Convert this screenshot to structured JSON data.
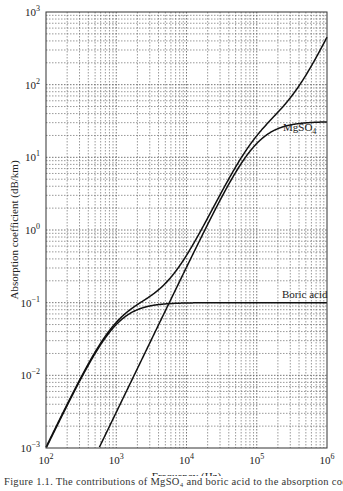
{
  "chart_data": {
    "type": "line",
    "title": "",
    "xlabel": "Frequency (Hz)",
    "ylabel": "Absorption coefficient (dB/km)",
    "xscale": "log",
    "yscale": "log",
    "xlim": [
      100,
      1000000
    ],
    "ylim": [
      0.001,
      1000
    ],
    "grid": true,
    "x_ticks": [
      {
        "value": 100,
        "base": "10",
        "exp": "2"
      },
      {
        "value": 1000,
        "base": "10",
        "exp": "3"
      },
      {
        "value": 10000,
        "base": "10",
        "exp": "4"
      },
      {
        "value": 100000,
        "base": "10",
        "exp": "5"
      },
      {
        "value": 1000000,
        "base": "10",
        "exp": "6"
      }
    ],
    "y_ticks": [
      {
        "value": 0.001,
        "base": "10",
        "exp": "−3"
      },
      {
        "value": 0.01,
        "base": "10",
        "exp": "−2"
      },
      {
        "value": 0.1,
        "base": "10",
        "exp": "−1"
      },
      {
        "value": 1,
        "base": "10",
        "exp": "0"
      },
      {
        "value": 10,
        "base": "10",
        "exp": "1"
      },
      {
        "value": 100,
        "base": "10",
        "exp": "2"
      },
      {
        "value": 1000,
        "base": "10",
        "exp": "3"
      }
    ],
    "series": [
      {
        "name": "Total",
        "label": "",
        "x": [
          100,
          200,
          500,
          1000,
          2000,
          5000,
          10000,
          20000,
          50000,
          100000,
          200000,
          500000,
          1000000
        ],
        "values": [
          0.001,
          0.0045,
          0.026,
          0.065,
          0.14,
          0.6,
          2.2,
          7.2,
          21,
          33,
          45,
          110,
          450
        ]
      },
      {
        "name": "MgSO4",
        "label": "MgSO",
        "label_sub": "4",
        "x": [
          300,
          1000,
          2000,
          5000,
          10000,
          20000,
          50000,
          100000,
          200000,
          500000,
          1000000
        ],
        "values": [
          0.001,
          0.011,
          0.045,
          0.28,
          1.1,
          4.2,
          17,
          27,
          30,
          31,
          31
        ]
      },
      {
        "name": "Boric acid",
        "label": "Boric acid",
        "x": [
          100,
          200,
          500,
          1000,
          2000,
          5000,
          10000,
          100000,
          1000000
        ],
        "values": [
          0.001,
          0.0042,
          0.022,
          0.05,
          0.08,
          0.097,
          0.1,
          0.1,
          0.1
        ]
      }
    ],
    "model": {
      "boric_acid": {
        "A": 0.1,
        "f_relax_hz": 1000
      },
      "mgso4": {
        "A": 31,
        "f_relax_hz": 100000
      },
      "pure_water_coeff": 0.00042
    }
  },
  "caption": "Figure 1.1.  The contributions of MgSO₄ and boric acid to the absorption coefficient"
}
